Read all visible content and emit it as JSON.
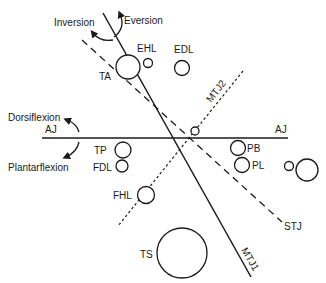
{
  "diagram": {
    "axes": {
      "aj": {
        "label_left": "AJ",
        "label_right": "AJ"
      },
      "stj": {
        "label": "STJ"
      },
      "mtj1": {
        "label": "MTJ1"
      },
      "mtj2": {
        "label": "MTJ2"
      }
    },
    "motions": {
      "inversion": "Inversion",
      "eversion": "Eversion",
      "dorsiflexion": "Dorsiflexion",
      "plantarflexion": "Plantarflexion"
    },
    "tendons": {
      "ta": "TA",
      "ehl": "EHL",
      "edl": "EDL",
      "tp": "TP",
      "fdl": "FDL",
      "fhl": "FHL",
      "pb": "PB",
      "pl": "PL",
      "ts": "TS"
    },
    "colors": {
      "ink": "#1a1a1a",
      "background": "#ffffff"
    }
  }
}
